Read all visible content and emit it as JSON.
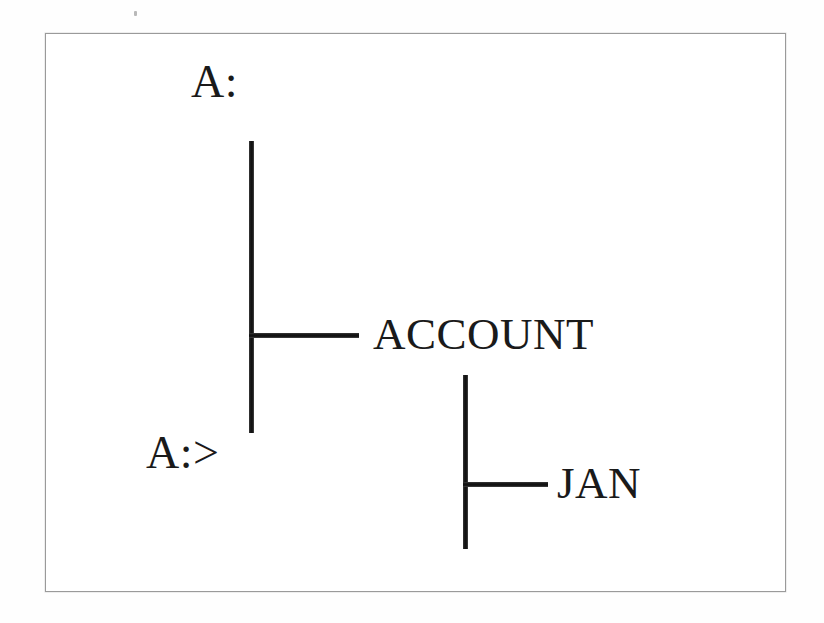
{
  "page": {
    "background_color": "#ffffff",
    "border_color": "#9a9a9a",
    "stroke_color": "#141414",
    "text_color": "#1a1a1a"
  },
  "diagram": {
    "type": "directory-tree",
    "title_label": "A:",
    "prompt_label": "A:>",
    "nodes": [
      {
        "label": "ACCOUNT",
        "level": 1
      },
      {
        "label": "JAN",
        "level": 2
      }
    ],
    "branches": [
      {
        "from": "A:",
        "to": "ACCOUNT"
      },
      {
        "from": "ACCOUNT",
        "to": "JAN"
      }
    ]
  }
}
